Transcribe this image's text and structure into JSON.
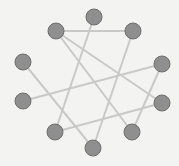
{
  "diagram": {
    "type": "graph",
    "title": "",
    "width": 179,
    "height": 166,
    "colors": {
      "background": "#f3f3f2",
      "node_fill": "#8f8f8f",
      "node_stroke": "#6e6e6e",
      "edge": "#c9c9c7"
    },
    "node_radius": 8,
    "nodes": [
      {
        "id": "top",
        "x": 94,
        "y": 17
      },
      {
        "id": "upper-right",
        "x": 133,
        "y": 31
      },
      {
        "id": "right-upper",
        "x": 162,
        "y": 64
      },
      {
        "id": "right-lower",
        "x": 162,
        "y": 103
      },
      {
        "id": "bottom-right",
        "x": 132,
        "y": 132
      },
      {
        "id": "bottom",
        "x": 93,
        "y": 148
      },
      {
        "id": "bottom-left",
        "x": 55,
        "y": 132
      },
      {
        "id": "left-lower",
        "x": 23,
        "y": 101
      },
      {
        "id": "left-upper",
        "x": 23,
        "y": 62
      },
      {
        "id": "upper-left",
        "x": 56,
        "y": 31
      }
    ],
    "edges": [
      {
        "from": "upper-left",
        "to": "upper-right"
      },
      {
        "from": "upper-left",
        "to": "right-lower"
      },
      {
        "from": "upper-left",
        "to": "bottom-right"
      },
      {
        "from": "top",
        "to": "bottom-left"
      },
      {
        "from": "upper-right",
        "to": "bottom"
      },
      {
        "from": "left-upper",
        "to": "bottom"
      },
      {
        "from": "left-lower",
        "to": "right-upper"
      },
      {
        "from": "right-upper",
        "to": "bottom-right"
      },
      {
        "from": "right-lower",
        "to": "bottom-left"
      }
    ]
  }
}
